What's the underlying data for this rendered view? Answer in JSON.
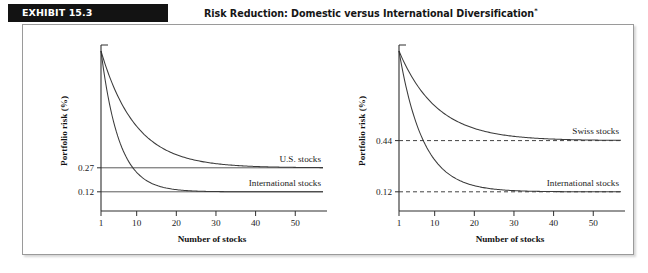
{
  "exhibit": {
    "tag": "EXHIBIT 15.3",
    "title": "Risk Reduction: Domestic versus International Diversification",
    "title_footnote": "*"
  },
  "chart_data": [
    {
      "type": "line",
      "panel": "left",
      "title": "",
      "xlabel": "Number of stocks",
      "ylabel": "Portfolio risk (%)",
      "xticks": [
        "1",
        "10",
        "20",
        "30",
        "40",
        "50"
      ],
      "xtick_values": [
        1,
        10,
        20,
        30,
        40,
        50
      ],
      "xlim": [
        1,
        57
      ],
      "ylim": [
        0,
        1.0
      ],
      "yticks": [
        "0.27",
        "0.12"
      ],
      "ytick_values": [
        0.27,
        0.12
      ],
      "grid": false,
      "reference_lines": [
        {
          "label": "0.27",
          "value": 0.27,
          "style": "solid"
        },
        {
          "label": "0.12",
          "value": 0.12,
          "style": "solid"
        }
      ],
      "legend_position": "inline-right",
      "series": [
        {
          "name": "U.S. stocks",
          "label": "U.S. stocks",
          "asymptote": 0.27,
          "start": 1.0,
          "decay": 0.115,
          "x": [
            1,
            5,
            10,
            15,
            20,
            25,
            30,
            35,
            40,
            45,
            50,
            55
          ],
          "values": [
            1.0,
            0.72,
            0.52,
            0.41,
            0.35,
            0.315,
            0.295,
            0.284,
            0.278,
            0.274,
            0.272,
            0.271
          ]
        },
        {
          "name": "International stocks",
          "label": "International stocks",
          "asymptote": 0.12,
          "start": 1.0,
          "decay": 0.22,
          "x": [
            1,
            5,
            10,
            15,
            20,
            25,
            30,
            35,
            40,
            45,
            50,
            55
          ],
          "values": [
            1.0,
            0.49,
            0.27,
            0.18,
            0.145,
            0.13,
            0.124,
            0.122,
            0.121,
            0.12,
            0.12,
            0.12
          ]
        }
      ]
    },
    {
      "type": "line",
      "panel": "right",
      "title": "",
      "xlabel": "Number of stocks",
      "ylabel": "Portfolio risk (%)",
      "xticks": [
        "1",
        "10",
        "20",
        "30",
        "40",
        "50"
      ],
      "xtick_values": [
        1,
        10,
        20,
        30,
        40,
        50
      ],
      "xlim": [
        1,
        57
      ],
      "ylim": [
        0,
        1.0
      ],
      "yticks": [
        "0.44",
        "0.12"
      ],
      "ytick_values": [
        0.44,
        0.12
      ],
      "grid": false,
      "reference_lines": [
        {
          "label": "0.44",
          "value": 0.44,
          "style": "dashed"
        },
        {
          "label": "0.12",
          "value": 0.12,
          "style": "dashed"
        }
      ],
      "legend_position": "inline-right",
      "series": [
        {
          "name": "Swiss stocks",
          "label": "Swiss stocks",
          "asymptote": 0.44,
          "start": 1.0,
          "decay": 0.105,
          "x": [
            1,
            5,
            10,
            15,
            20,
            25,
            30,
            35,
            40,
            45,
            50,
            55
          ],
          "values": [
            1.0,
            0.8,
            0.65,
            0.565,
            0.515,
            0.487,
            0.47,
            0.46,
            0.453,
            0.449,
            0.447,
            0.445
          ]
        },
        {
          "name": "International stocks",
          "label": "International stocks",
          "asymptote": 0.12,
          "start": 1.0,
          "decay": 0.165,
          "x": [
            1,
            5,
            10,
            15,
            20,
            25,
            30,
            35,
            40,
            45,
            50,
            55
          ],
          "values": [
            1.0,
            0.58,
            0.36,
            0.245,
            0.185,
            0.155,
            0.14,
            0.131,
            0.126,
            0.123,
            0.121,
            0.12
          ]
        }
      ]
    }
  ]
}
